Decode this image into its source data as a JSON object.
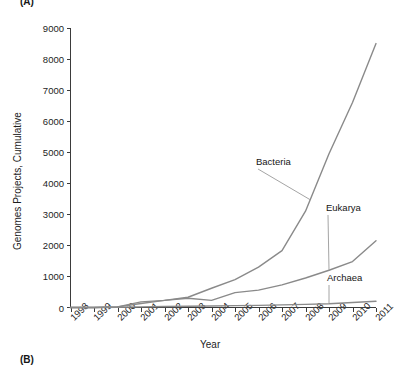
{
  "figure": {
    "panel_a_tag": "(A)",
    "panel_b_tag": "(B)"
  },
  "chart_data": {
    "type": "line",
    "title": "",
    "xlabel": "Year",
    "ylabel": "Genomes Projects, Cumulative",
    "x": [
      1998,
      1999,
      2000,
      2001,
      2002,
      2003,
      2004,
      2005,
      2006,
      2007,
      2008,
      2009,
      2010,
      2011
    ],
    "categories": [
      "1998",
      "1999",
      "2000",
      "2001",
      "2002",
      "2003",
      "2004",
      "2005",
      "2006",
      "2007",
      "2008",
      "2009",
      "2010",
      "2011"
    ],
    "xlim": [
      1998,
      2011
    ],
    "ylim": [
      0,
      9000
    ],
    "yticks": [
      0,
      1000,
      2000,
      3000,
      4000,
      5000,
      6000,
      7000,
      8000,
      9000
    ],
    "ytick_labels": [
      "0",
      "1000",
      "2000",
      "3000",
      "4000",
      "5000",
      "6000",
      "7000",
      "8000",
      "9000"
    ],
    "grid": false,
    "legend": "inline-annotations",
    "line_color": "#8a8a8a",
    "axis_color": "#3b3b3b",
    "series": [
      {
        "name": "Bacteria",
        "label": "Bacteria",
        "values": [
          0,
          0,
          20,
          130,
          230,
          330,
          620,
          900,
          1300,
          1830,
          3100,
          4950,
          6600,
          8500
        ]
      },
      {
        "name": "Eukarya",
        "label": "Eukarya",
        "values": [
          0,
          0,
          20,
          180,
          230,
          300,
          230,
          480,
          560,
          730,
          950,
          1200,
          1480,
          2150
        ]
      },
      {
        "name": "Archaea",
        "label": "Archaea",
        "values": [
          0,
          0,
          10,
          20,
          30,
          40,
          50,
          60,
          70,
          85,
          100,
          120,
          160,
          200
        ]
      }
    ],
    "annotations": [
      {
        "text": "Bacteria",
        "x_px": 256,
        "y_px": 156
      },
      {
        "text": "Eukarya",
        "x_px": 326,
        "y_px": 202
      },
      {
        "text": "Archaea",
        "x_px": 327,
        "y_px": 272
      }
    ]
  }
}
